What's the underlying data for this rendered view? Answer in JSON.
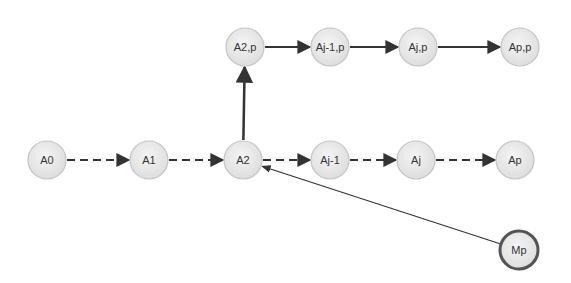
{
  "diagram": {
    "type": "directed-graph",
    "nodes": [
      {
        "id": "A0",
        "label": "A0",
        "style": "normal"
      },
      {
        "id": "A1",
        "label": "A1",
        "style": "normal"
      },
      {
        "id": "A2",
        "label": "A2",
        "style": "normal"
      },
      {
        "id": "Aj-1",
        "label": "Aj-1",
        "style": "normal"
      },
      {
        "id": "Aj",
        "label": "Aj",
        "style": "normal"
      },
      {
        "id": "Ap",
        "label": "Ap",
        "style": "normal"
      },
      {
        "id": "A2,p",
        "label": "A2,p",
        "style": "normal"
      },
      {
        "id": "Aj-1,p",
        "label": "Aj-1,p",
        "style": "normal"
      },
      {
        "id": "Aj,p",
        "label": "Aj,p",
        "style": "normal"
      },
      {
        "id": "Ap,p",
        "label": "Ap,p",
        "style": "normal"
      },
      {
        "id": "Mp",
        "label": "Mp",
        "style": "bold-outline"
      }
    ],
    "edges": [
      {
        "from": "A0",
        "to": "A1",
        "style": "dashed"
      },
      {
        "from": "A1",
        "to": "A2",
        "style": "dashed"
      },
      {
        "from": "A2",
        "to": "Aj-1",
        "style": "dashed"
      },
      {
        "from": "Aj-1",
        "to": "Aj",
        "style": "dashed"
      },
      {
        "from": "Aj",
        "to": "Ap",
        "style": "dashed"
      },
      {
        "from": "A2",
        "to": "A2,p",
        "style": "solid-thick"
      },
      {
        "from": "A2,p",
        "to": "Aj-1,p",
        "style": "solid"
      },
      {
        "from": "Aj-1,p",
        "to": "Aj,p",
        "style": "solid"
      },
      {
        "from": "Aj,p",
        "to": "Ap,p",
        "style": "solid"
      },
      {
        "from": "Mp",
        "to": "A2",
        "style": "thin"
      }
    ],
    "colors": {
      "node_fill": "#e6e6e6",
      "node_stroke": "#c4c4c4",
      "bold_stroke": "#555555",
      "edge": "#333333",
      "label": "#333333"
    }
  }
}
